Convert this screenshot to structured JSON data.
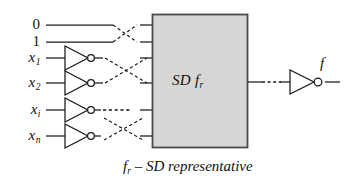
{
  "figure": {
    "caption_prefix": "f",
    "caption_sub": "r",
    "caption_rest": "– SD representative",
    "background_color": "#ffffff",
    "line_color": "#1a1a1a",
    "box_fill_color": "#d6d6d6",
    "box_border_color": "#4a4a4a"
  },
  "inputs": [
    {
      "name": "const-0",
      "base": "0",
      "sub": "",
      "y": 25,
      "has_inverter": false
    },
    {
      "name": "const-1",
      "base": "1",
      "sub": "",
      "y": 42,
      "has_inverter": false
    },
    {
      "name": "x1",
      "base": "x",
      "sub": "1",
      "y": 58,
      "has_inverter": true
    },
    {
      "name": "x2",
      "base": "x",
      "sub": "2",
      "y": 83,
      "has_inverter": true
    },
    {
      "name": "xi",
      "base": "x",
      "sub": "i",
      "y": 110,
      "has_inverter": true
    },
    {
      "name": "xn",
      "base": "x",
      "sub": "n",
      "y": 136,
      "has_inverter": true
    }
  ],
  "block": {
    "label_main": "SD f",
    "label_sub": "r",
    "x": 152,
    "y": 14,
    "width": 96,
    "height": 134
  },
  "output": {
    "label": "f",
    "y": 82,
    "gate": "inverter",
    "dashed_connector": true
  },
  "crossings": [
    {
      "name": "crossing-top",
      "between": [
        "const-0",
        "const-1"
      ]
    },
    {
      "name": "crossing-middle",
      "between": [
        "x1",
        "x2"
      ]
    },
    {
      "name": "crossing-bottom",
      "between": [
        "xi",
        "xn"
      ]
    }
  ],
  "dashed_rows": [
    {
      "name": "ellipsis-row-xi",
      "y": 110
    }
  ]
}
